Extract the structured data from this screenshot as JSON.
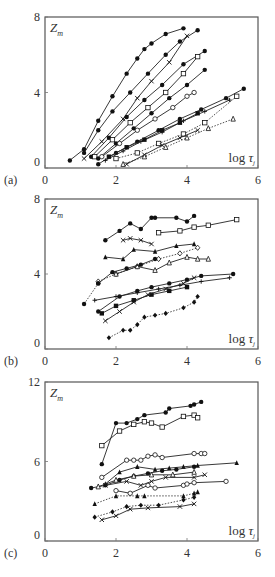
{
  "figure": {
    "width": 275,
    "height": 577
  },
  "chart_data": [
    {
      "panel": "(a)",
      "type": "line",
      "ylabel": "Z_m",
      "xlabel": "log τ_j",
      "xlim": [
        0,
        6
      ],
      "ylim": [
        0,
        8
      ],
      "xticks": [
        "0",
        "2",
        "4",
        "6"
      ],
      "yticks": [
        "0",
        "4",
        "8"
      ],
      "grid": false,
      "series": [
        {
          "marker": "filled-circle",
          "style": "solid",
          "x": [
            0.7,
            1.1,
            1.5,
            1.9,
            2.3,
            2.6,
            2.8,
            3.0,
            3.4,
            3.9
          ],
          "y": [
            0.4,
            1.0,
            2.5,
            3.8,
            5.0,
            5.8,
            6.3,
            6.6,
            7.1,
            7.4
          ]
        },
        {
          "marker": "filled-circle",
          "style": "solid",
          "x": [
            1.1,
            1.5,
            1.9,
            2.4,
            2.9,
            3.4,
            3.8,
            4.3
          ],
          "y": [
            0.8,
            2.0,
            3.0,
            4.0,
            5.0,
            6.0,
            6.7,
            7.3
          ]
        },
        {
          "marker": "cross",
          "style": "solid",
          "x": [
            1.1,
            1.6,
            2.2,
            2.6,
            3.0,
            3.5,
            4.0
          ],
          "y": [
            0.5,
            1.4,
            2.6,
            3.7,
            4.6,
            5.6,
            7.0
          ]
        },
        {
          "marker": "filled-circle",
          "style": "solid",
          "x": [
            1.3,
            1.8,
            2.3,
            2.8,
            3.3,
            3.9,
            4.5
          ],
          "y": [
            0.6,
            1.6,
            2.7,
            3.6,
            4.4,
            5.5,
            6.2
          ]
        },
        {
          "marker": "open-square",
          "style": "solid",
          "x": [
            1.4,
            1.9,
            2.4,
            2.9,
            3.4,
            3.9,
            4.3
          ],
          "y": [
            0.6,
            1.5,
            2.4,
            3.2,
            4.0,
            5.0,
            5.9
          ]
        },
        {
          "marker": "filled-circle",
          "style": "solid",
          "x": [
            1.5,
            2.0,
            2.5,
            3.0,
            3.5,
            4.0,
            4.5
          ],
          "y": [
            0.5,
            1.3,
            2.1,
            2.9,
            3.7,
            4.4,
            5.2
          ]
        },
        {
          "marker": "open-circle",
          "style": "solid",
          "x": [
            1.6,
            2.1,
            2.6,
            3.1,
            3.6,
            4.0,
            4.2
          ],
          "y": [
            0.6,
            1.3,
            2.0,
            2.6,
            3.2,
            3.8,
            4.0
          ]
        },
        {
          "marker": "filled-circle",
          "style": "solid",
          "x": [
            1.5,
            2.0,
            2.6,
            3.2,
            3.8,
            4.4,
            5.1,
            5.6
          ],
          "y": [
            0.2,
            0.8,
            1.4,
            2.0,
            2.6,
            3.1,
            3.7,
            4.2
          ]
        },
        {
          "marker": "plus",
          "style": "solid",
          "x": [
            1.7,
            2.2,
            2.7,
            3.3,
            3.9,
            4.5,
            5.2
          ],
          "y": [
            0.4,
            0.9,
            1.4,
            1.9,
            2.5,
            3.0,
            3.6
          ]
        },
        {
          "marker": "filled-square",
          "style": "solid",
          "x": [
            1.8,
            2.3,
            2.8,
            3.3,
            3.8,
            4.3
          ],
          "y": [
            0.6,
            1.1,
            1.5,
            2.0,
            2.4,
            2.9
          ]
        },
        {
          "marker": "open-square",
          "style": "dotted",
          "x": [
            2.0,
            2.6,
            3.2,
            3.9,
            4.5,
            5.4
          ],
          "y": [
            0.5,
            0.8,
            1.3,
            1.8,
            2.4,
            3.8
          ]
        },
        {
          "marker": "cross",
          "style": "solid",
          "x": [
            2.3,
            2.8,
            3.3,
            3.8,
            4.3
          ],
          "y": [
            0.2,
            0.7,
            1.2,
            1.6,
            2.0
          ]
        },
        {
          "marker": "open-triangle",
          "style": "dotted",
          "x": [
            2.2,
            2.8,
            3.4,
            4.0,
            4.6,
            5.3
          ],
          "y": [
            0.2,
            0.6,
            1.1,
            1.6,
            2.1,
            2.6
          ]
        }
      ]
    },
    {
      "panel": "(b)",
      "type": "line",
      "ylabel": "Z_m",
      "xlabel": "log τ_j",
      "xlim": [
        0,
        6
      ],
      "ylim": [
        0,
        8
      ],
      "xticks": [
        "0",
        "2",
        "4",
        "6"
      ],
      "yticks": [
        "0",
        "4",
        "8"
      ],
      "grid": false,
      "series": [
        {
          "marker": "filled-circle",
          "style": "solid",
          "x": [
            1.7,
            2.1,
            2.4,
            2.7,
            3.0,
            3.1,
            3.7,
            4.0,
            4.2
          ],
          "y": [
            5.8,
            6.3,
            6.7,
            6.4,
            7.0,
            7.0,
            7.0,
            6.8,
            7.1
          ]
        },
        {
          "marker": "open-square",
          "style": "solid",
          "x": [
            3.2,
            3.8,
            4.2,
            4.6,
            5.4
          ],
          "y": [
            6.2,
            6.3,
            6.5,
            6.6,
            6.9
          ]
        },
        {
          "marker": "cross",
          "style": "solid",
          "x": [
            2.2,
            2.4,
            2.7,
            3.0
          ],
          "y": [
            5.8,
            5.9,
            5.8,
            5.6
          ]
        },
        {
          "marker": "filled-triangle",
          "style": "solid",
          "x": [
            1.7,
            2.2,
            2.5,
            3.1,
            3.7,
            4.2
          ],
          "y": [
            4.9,
            4.8,
            5.3,
            5.2,
            5.5,
            5.6
          ]
        },
        {
          "marker": "open-diamond",
          "style": "dotted",
          "x": [
            1.5,
            2.0,
            2.6,
            3.2,
            3.8,
            4.3
          ],
          "y": [
            3.6,
            4.0,
            4.4,
            4.8,
            5.1,
            5.4
          ]
        },
        {
          "marker": "open-triangle",
          "style": "solid",
          "x": [
            2.0,
            2.6,
            3.1,
            3.5,
            4.0,
            4.3,
            4.6
          ],
          "y": [
            4.0,
            4.4,
            4.2,
            4.6,
            4.9,
            4.8,
            4.8
          ]
        },
        {
          "marker": "filled-circle",
          "style": "solid",
          "x": [
            1.5,
            1.9,
            2.3,
            2.7,
            3.1
          ],
          "y": [
            3.5,
            4.1,
            4.3,
            4.5,
            4.8
          ]
        },
        {
          "marker": "filled-circle",
          "style": "dotted",
          "x": [
            1.1,
            1.5
          ],
          "y": [
            2.4,
            3.5
          ]
        },
        {
          "marker": "filled-circle",
          "style": "solid",
          "x": [
            1.5,
            2.1,
            2.6,
            3.0,
            3.5,
            4.0,
            4.4,
            5.3
          ],
          "y": [
            2.0,
            2.8,
            3.1,
            3.3,
            3.5,
            3.7,
            3.9,
            4.0
          ]
        },
        {
          "marker": "plus",
          "style": "solid",
          "x": [
            1.4,
            2.0,
            2.6,
            3.2,
            3.8,
            4.4,
            5.2
          ],
          "y": [
            2.6,
            2.8,
            3.0,
            3.2,
            3.4,
            3.6,
            3.8
          ]
        },
        {
          "marker": "filled-square",
          "style": "solid",
          "x": [
            1.6,
            2.0,
            2.5,
            3.0,
            3.5,
            4.0
          ],
          "y": [
            1.9,
            2.3,
            2.6,
            2.9,
            3.1,
            3.3
          ]
        },
        {
          "marker": "cross",
          "style": "solid",
          "x": [
            1.7,
            2.1,
            2.5,
            2.9,
            3.4,
            3.9,
            4.2
          ],
          "y": [
            1.5,
            2.0,
            2.5,
            2.9,
            3.2,
            3.5,
            3.8
          ]
        },
        {
          "marker": "filled-diamond",
          "style": "dotted",
          "x": [
            1.8,
            2.2,
            2.4,
            2.6,
            2.8,
            3.1,
            3.4,
            3.9,
            4.2,
            4.3
          ],
          "y": [
            0.6,
            1.0,
            1.0,
            1.3,
            1.7,
            1.8,
            1.9,
            2.2,
            2.5,
            2.8
          ]
        }
      ]
    },
    {
      "panel": "(c)",
      "type": "line",
      "ylabel": "Z_m",
      "xlabel": "log τ_j",
      "xlim": [
        0,
        6
      ],
      "ylim": [
        0,
        12
      ],
      "xticks": [
        "0",
        "2",
        "4",
        "6"
      ],
      "yticks": [
        "0",
        "6",
        "12"
      ],
      "grid": false,
      "series": [
        {
          "marker": "filled-circle",
          "style": "solid",
          "x": [
            1.6,
            2.0,
            2.3,
            2.6,
            2.8,
            3.4,
            3.5,
            4.1,
            4.2,
            4.4
          ],
          "y": [
            5.8,
            8.9,
            8.9,
            9.2,
            9.5,
            9.7,
            10.0,
            10.2,
            10.3,
            10.5
          ]
        },
        {
          "marker": "open-square",
          "style": "solid",
          "x": [
            1.6,
            2.1,
            2.5,
            2.8,
            3.0,
            3.3,
            3.9,
            4.2,
            4.3
          ],
          "y": [
            7.2,
            8.3,
            8.8,
            9.0,
            8.9,
            8.6,
            9.4,
            9.5,
            9.3
          ]
        },
        {
          "marker": "open-circle",
          "style": "solid",
          "x": [
            1.6,
            2.3,
            2.5,
            2.7,
            2.9,
            3.1,
            3.3,
            4.2,
            4.4,
            4.5
          ],
          "y": [
            4.8,
            6.1,
            6.1,
            6.1,
            6.4,
            6.5,
            6.3,
            6.6,
            6.6,
            6.6
          ]
        },
        {
          "marker": "filled-triangle",
          "style": "solid",
          "x": [
            1.7,
            2.1,
            2.6,
            3.1,
            3.5,
            3.9,
            4.3,
            5.4
          ],
          "y": [
            4.3,
            5.2,
            5.6,
            5.4,
            5.5,
            5.6,
            5.7,
            5.9
          ]
        },
        {
          "marker": "filled-circle",
          "style": "solid",
          "x": [
            1.3,
            1.7,
            2.1,
            2.5,
            2.9,
            3.3,
            3.7,
            4.2
          ],
          "y": [
            4.0,
            4.2,
            4.6,
            4.9,
            5.1,
            5.3,
            5.4,
            5.6
          ]
        },
        {
          "marker": "open-triangle",
          "style": "solid",
          "x": [
            1.5,
            2.0,
            2.5,
            3.0,
            3.6,
            4.2
          ],
          "y": [
            4.1,
            4.6,
            4.9,
            5.0,
            5.0,
            5.2
          ]
        },
        {
          "marker": "cross",
          "style": "solid",
          "x": [
            1.7,
            2.3,
            2.7,
            3.0,
            3.4,
            4.2,
            4.5
          ],
          "y": [
            4.2,
            4.5,
            4.2,
            4.5,
            4.8,
            4.8,
            5.0
          ]
        },
        {
          "marker": "open-circle",
          "style": "solid",
          "x": [
            2.0,
            2.4,
            2.9,
            3.1,
            3.9,
            4.0,
            4.2,
            5.1
          ],
          "y": [
            3.8,
            3.6,
            4.2,
            4.0,
            4.2,
            4.3,
            4.4,
            4.5
          ]
        },
        {
          "marker": "filled-triangle",
          "style": "dotted",
          "x": [
            1.4,
            2.0,
            2.6,
            2.8,
            3.9,
            4.2,
            4.3
          ],
          "y": [
            2.8,
            3.4,
            3.4,
            3.4,
            3.4,
            3.6,
            3.7
          ]
        },
        {
          "marker": "filled-diamond",
          "style": "dotted",
          "x": [
            1.4,
            1.9,
            2.3,
            2.7,
            3.2,
            3.9,
            4.2
          ],
          "y": [
            1.8,
            2.2,
            2.6,
            2.7,
            2.7,
            3.1,
            3.3
          ]
        },
        {
          "marker": "cross",
          "style": "solid",
          "x": [
            1.6,
            2.0,
            2.4,
            2.9,
            3.8,
            4.2
          ],
          "y": [
            1.6,
            1.9,
            2.4,
            2.5,
            2.6,
            2.8
          ]
        }
      ]
    }
  ]
}
